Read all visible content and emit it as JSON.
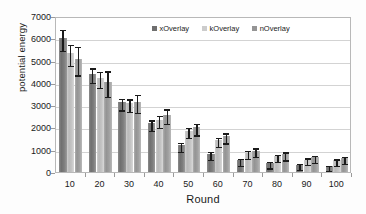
{
  "chart_data": {
    "type": "bar",
    "title": "",
    "subtitle": "",
    "xlabel": "Round",
    "ylabel": "potential energy",
    "categories": [
      "10",
      "20",
      "30",
      "40",
      "50",
      "60",
      "70",
      "80",
      "90",
      "100"
    ],
    "ylim": [
      0,
      7000
    ],
    "ytick_values": [
      0,
      1000,
      2000,
      3000,
      4000,
      5000,
      6000,
      7000
    ],
    "ytick_labels": [
      "0",
      "1000",
      "2000",
      "3000",
      "4000",
      "5000",
      "6000",
      "7000"
    ],
    "grid": "horizontal",
    "legend_position": "top-center-inside",
    "error_bars": "symmetric",
    "series": [
      {
        "name": "xOverlay",
        "color": "#6f6f6f",
        "values": [
          6000,
          4420,
          3120,
          2180,
          1200,
          820,
          520,
          400,
          320,
          250
        ],
        "errors": [
          480,
          330,
          260,
          230,
          200,
          180,
          160,
          140,
          130,
          120
        ]
      },
      {
        "name": "kOverlay",
        "color": "#cccccc",
        "values": [
          5320,
          4230,
          3080,
          2340,
          1850,
          1430,
          860,
          700,
          560,
          520
        ],
        "errors": [
          470,
          350,
          280,
          260,
          230,
          200,
          180,
          160,
          150,
          140
        ]
      },
      {
        "name": "nOverlay",
        "color": "#959595",
        "values": [
          5060,
          4030,
          3150,
          2580,
          2000,
          1600,
          960,
          800,
          660,
          620
        ],
        "errors": [
          640,
          570,
          400,
          320,
          260,
          230,
          200,
          180,
          170,
          160
        ]
      }
    ]
  }
}
